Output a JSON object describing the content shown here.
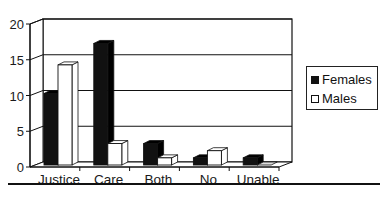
{
  "chart_data": {
    "type": "bar",
    "style": "3d-clustered-column",
    "title": "",
    "xlabel": "",
    "ylabel": "",
    "categories": [
      "Justice",
      "Care",
      "Both",
      "No",
      "Unable"
    ],
    "series": [
      {
        "name": "Females",
        "color": "#111111",
        "values": [
          10,
          17,
          3,
          1,
          1
        ]
      },
      {
        "name": "Males",
        "color": "#ffffff",
        "values": [
          14,
          3,
          1,
          2,
          0
        ]
      }
    ],
    "ylim": [
      0,
      20
    ],
    "yticks": [
      0,
      5,
      10,
      15,
      20
    ],
    "grid": true,
    "legend_position": "right"
  },
  "legend": {
    "items": [
      {
        "label": "Females",
        "color": "#111111"
      },
      {
        "label": "Males",
        "color": "#ffffff"
      }
    ]
  }
}
